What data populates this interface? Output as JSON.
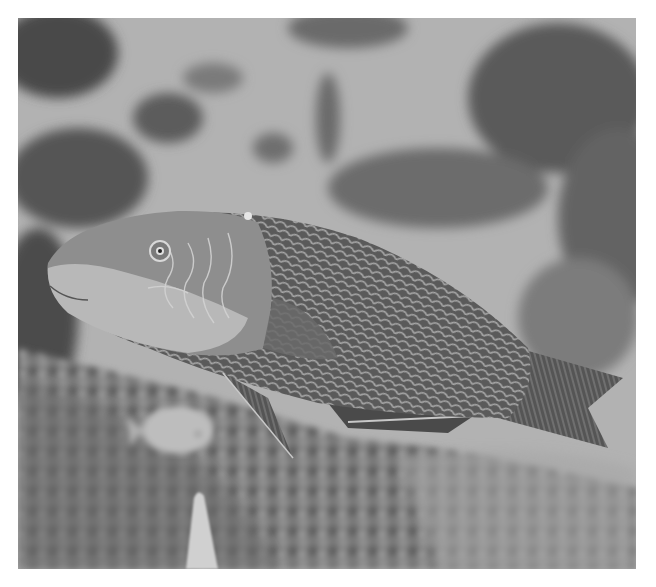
{
  "image": {
    "subject": "wrasse fish swimming over coral reef",
    "tone": "grayscale",
    "frame": {
      "x": 18,
      "y": 18,
      "width": 618,
      "height": 551
    },
    "background_color": "#ffffff",
    "elements": [
      {
        "name": "main-fish",
        "description": "large wrasse with scaled body, light head, patterned cheek, forked tail"
      },
      {
        "name": "small-fish",
        "description": "small pale fish at lower left"
      },
      {
        "name": "coral-reef",
        "description": "blurred rocky coral substrate in lower area"
      },
      {
        "name": "dark-coral-clumps",
        "description": "dark blurred coral clusters in background"
      },
      {
        "name": "branching-coral",
        "description": "pale branching coral tip at bottom"
      }
    ],
    "colors": {
      "water_light": "#b4b4b4",
      "coral_dark": "#4a4a4a",
      "fish_body": "#5e5e5e",
      "fish_head": "#9c9c9c",
      "fish_face": "#bdbdbd"
    }
  }
}
